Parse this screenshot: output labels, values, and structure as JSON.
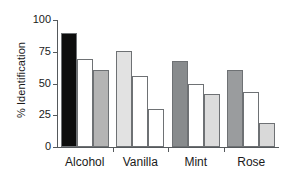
{
  "chart_data": {
    "type": "bar",
    "title": "",
    "xlabel": "",
    "ylabel": "% Identification",
    "ylim": [
      0,
      100
    ],
    "yticks": [
      0,
      25,
      50,
      75,
      100
    ],
    "ytick_labels": [
      "0",
      "25",
      "50",
      "75",
      "100"
    ],
    "grid": false,
    "legend": "none",
    "categories": [
      "Alcohol",
      "Vanilla",
      "Mint",
      "Rose"
    ],
    "series": [
      {
        "name": "bar-1",
        "values": [
          90,
          75.5,
          68,
          60.5
        ]
      },
      {
        "name": "bar-2",
        "values": [
          69,
          56,
          49.5,
          43
        ]
      },
      {
        "name": "bar-3",
        "values": [
          60.5,
          30,
          42,
          19
        ]
      }
    ],
    "bar_colors": [
      [
        "#0d0d0d",
        "#ffffff",
        "#b4b4b4"
      ],
      [
        "#e2e2e2",
        "#ffffff",
        "#ffffff"
      ],
      [
        "#888b8d",
        "#ffffff",
        "#dcdcdc"
      ],
      [
        "#9a9c9e",
        "#ffffff",
        "#d9d9d9"
      ]
    ],
    "bar_edge_color": "#6e7174",
    "axis_color": "#55595c",
    "background": "#ffffff"
  }
}
